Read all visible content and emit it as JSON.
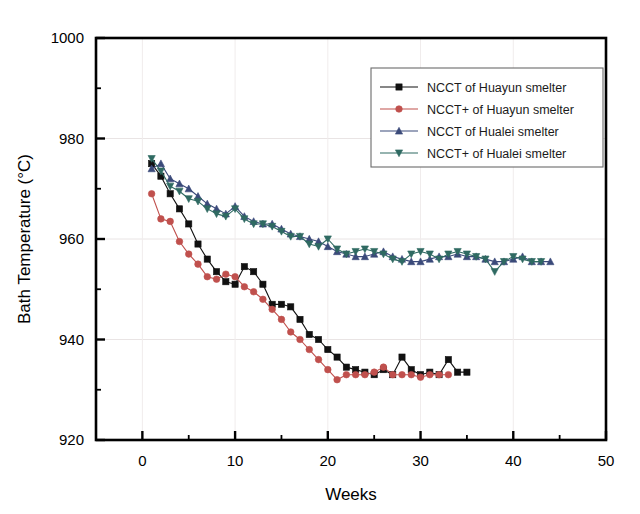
{
  "chart_data": {
    "type": "line",
    "title": "",
    "xlabel": "Weeks",
    "ylabel": "Bath Temperature (°C)",
    "xlim": [
      -5,
      50
    ],
    "ylim": [
      920,
      1000
    ],
    "xticks": [
      0,
      10,
      20,
      30,
      40,
      50
    ],
    "xtick_labels": [
      "0",
      "10",
      "20",
      "30",
      "40",
      "50"
    ],
    "yticks": [
      920,
      940,
      960,
      980,
      1000
    ],
    "ytick_labels": [
      "920",
      "940",
      "960",
      "980",
      "1000"
    ],
    "xminor_step": 5,
    "yminor_step": 10,
    "grid": false,
    "legend_position": "upper right",
    "series": [
      {
        "name": "NCCT   of Huayun smelter",
        "color": "#111111",
        "marker": "square",
        "x": [
          1,
          2,
          3,
          4,
          5,
          6,
          7,
          8,
          9,
          10,
          11,
          12,
          13,
          14,
          15,
          16,
          17,
          18,
          19,
          20,
          21,
          22,
          23,
          24,
          25,
          26,
          27,
          28,
          29,
          30,
          31,
          32,
          33,
          34,
          35
        ],
        "y": [
          975.0,
          972.5,
          969.0,
          966.0,
          963.0,
          959.0,
          956.0,
          953.5,
          951.5,
          951.0,
          954.5,
          953.5,
          951.0,
          947.0,
          947.0,
          946.5,
          944.0,
          941.0,
          940.0,
          938.0,
          936.5,
          934.5,
          934.0,
          933.5,
          933.0,
          934.0,
          933.0,
          936.5,
          934.0,
          933.0,
          933.5,
          933.0,
          936.0,
          933.5,
          933.5
        ]
      },
      {
        "name": "NCCT+ of Huayun smelter",
        "color": "#c0504d",
        "marker": "circle",
        "x": [
          1,
          2,
          3,
          4,
          5,
          6,
          7,
          8,
          9,
          10,
          11,
          12,
          13,
          14,
          15,
          16,
          17,
          18,
          19,
          20,
          21,
          22,
          23,
          24,
          25,
          26,
          27,
          28,
          29,
          30,
          31,
          32,
          33
        ],
        "y": [
          969.0,
          964.0,
          963.5,
          959.5,
          957.0,
          955.0,
          952.5,
          952.0,
          953.0,
          952.5,
          950.5,
          949.5,
          948.0,
          946.0,
          944.0,
          941.5,
          940.0,
          938.0,
          936.0,
          934.0,
          932.0,
          933.0,
          933.0,
          933.0,
          933.5,
          934.5,
          933.0,
          933.0,
          933.0,
          932.5,
          933.0,
          933.0,
          933.0
        ]
      },
      {
        "name": "NCCT   of Hualei smelter",
        "color": "#3b4a7a",
        "marker": "triangle-up",
        "x": [
          1,
          2,
          3,
          4,
          5,
          6,
          7,
          8,
          9,
          10,
          11,
          12,
          13,
          14,
          15,
          16,
          17,
          18,
          19,
          20,
          21,
          22,
          23,
          24,
          25,
          26,
          27,
          28,
          29,
          30,
          31,
          32,
          33,
          34,
          35,
          36,
          37,
          38,
          39,
          40,
          41,
          42,
          43,
          44
        ],
        "y": [
          974.0,
          975.0,
          972.0,
          971.0,
          970.0,
          968.5,
          967.0,
          966.0,
          965.0,
          966.5,
          964.5,
          963.5,
          963.0,
          963.0,
          962.0,
          961.0,
          960.5,
          960.0,
          959.5,
          958.5,
          957.5,
          957.0,
          956.5,
          956.5,
          957.0,
          957.5,
          956.5,
          956.0,
          955.5,
          955.5,
          956.0,
          956.5,
          956.5,
          957.0,
          956.5,
          956.5,
          956.0,
          955.5,
          955.5,
          956.0,
          956.5,
          955.5,
          955.5,
          955.5
        ]
      },
      {
        "name": "NCCT+ of Hualei smelter",
        "color": "#2f6a62",
        "marker": "triangle-down",
        "x": [
          1,
          2,
          3,
          4,
          5,
          6,
          7,
          8,
          9,
          10,
          11,
          12,
          13,
          14,
          15,
          16,
          17,
          18,
          19,
          20,
          21,
          22,
          23,
          24,
          25,
          26,
          27,
          28,
          29,
          30,
          31,
          32,
          33,
          34,
          35,
          36,
          37,
          38,
          39,
          40,
          41,
          42,
          43
        ],
        "y": [
          976.0,
          973.5,
          970.5,
          969.5,
          968.0,
          967.5,
          966.0,
          965.0,
          964.5,
          966.0,
          964.0,
          963.0,
          963.0,
          962.5,
          961.5,
          960.5,
          960.5,
          959.0,
          958.5,
          960.0,
          958.0,
          957.0,
          957.5,
          958.0,
          957.5,
          957.0,
          956.0,
          955.5,
          957.0,
          957.5,
          957.0,
          956.0,
          957.0,
          957.5,
          957.0,
          956.5,
          956.0,
          953.5,
          955.5,
          956.5,
          956.0,
          955.5,
          955.5
        ]
      }
    ]
  },
  "legend": {
    "items": [
      {
        "label": "NCCT   of Huayun smelter",
        "color": "#111111",
        "marker": "square"
      },
      {
        "label": "NCCT+ of Huayun smelter",
        "color": "#c0504d",
        "marker": "circle"
      },
      {
        "label": "NCCT   of Hualei smelter",
        "color": "#3b4a7a",
        "marker": "triangle-up"
      },
      {
        "label": "NCCT+ of Hualei smelter",
        "color": "#2f6a62",
        "marker": "triangle-down"
      }
    ]
  },
  "colors": {
    "axis": "#000000",
    "background": "#ffffff",
    "series_black": "#111111",
    "series_red": "#c0504d",
    "series_navy": "#3b4a7a",
    "series_teal": "#2f6a62"
  }
}
